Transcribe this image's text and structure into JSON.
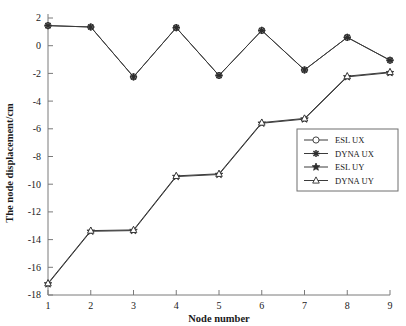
{
  "chart_data": {
    "type": "line",
    "title": "",
    "xlabel": "Node number",
    "ylabel": "The node displacement/cm",
    "x": [
      1,
      2,
      3,
      4,
      5,
      6,
      7,
      8,
      9
    ],
    "xtick_labels": [
      "1",
      "2",
      "3",
      "4",
      "5",
      "6",
      "7",
      "8",
      "9"
    ],
    "xlim": [
      1,
      9
    ],
    "ylim": [
      -18,
      2
    ],
    "ytick_labels": [
      "2",
      "0",
      "-2",
      "-4",
      "-6",
      "-8",
      "-10",
      "-12",
      "-14",
      "-16",
      "-18"
    ],
    "ytick_values": [
      2,
      0,
      -2,
      -4,
      -6,
      -8,
      -10,
      -12,
      -14,
      -16,
      -18
    ],
    "grid": false,
    "legend_position": "center-right",
    "series": [
      {
        "name": "ESL UX",
        "marker": "circle-open",
        "values": [
          1.45,
          1.35,
          -2.25,
          1.3,
          -2.15,
          1.1,
          -1.75,
          0.6,
          -1.05
        ]
      },
      {
        "name": "DYNA UX",
        "marker": "asterisk",
        "values": [
          1.45,
          1.35,
          -2.25,
          1.3,
          -2.15,
          1.1,
          -1.75,
          0.6,
          -1.05
        ]
      },
      {
        "name": "ESL UY",
        "marker": "star-filled",
        "values": [
          -17.2,
          -13.4,
          -13.35,
          -9.45,
          -9.3,
          -5.6,
          -5.3,
          -2.25,
          -1.95
        ]
      },
      {
        "name": "DYNA UY",
        "marker": "triangle-open",
        "values": [
          -17.15,
          -13.35,
          -13.3,
          -9.4,
          -9.25,
          -5.55,
          -5.25,
          -2.2,
          -1.9
        ]
      }
    ]
  },
  "legend": {
    "entries": [
      {
        "label": "ESL UX"
      },
      {
        "label": "DYNA UX"
      },
      {
        "label": "ESL UY"
      },
      {
        "label": "DYNA UY"
      }
    ]
  },
  "axes": {
    "x_title": "Node number",
    "y_title": "The node displacement/cm"
  },
  "colors": {
    "line": "#3b3b3b",
    "axis": "#7a7a7a",
    "marker": "#2e2e2e",
    "background": "#ffffff"
  }
}
